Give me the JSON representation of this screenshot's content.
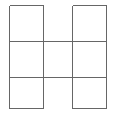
{
  "figure": {
    "shape_name": "H-tetromino-grid",
    "background_color": "#ffffff",
    "line_color": "#666666",
    "line_width": 1,
    "canvas": {
      "width": 115,
      "height": 114
    }
  },
  "grid": {
    "columns": 3,
    "rows": 3,
    "x_positions": [
      9,
      43,
      72,
      106
    ],
    "y_positions": [
      5,
      41,
      77,
      108
    ],
    "cell_labels": [
      "left-top",
      "center-top",
      "right-top",
      "left-middle",
      "center-middle",
      "right-middle",
      "left-bottom",
      "center-bottom",
      "right-bottom"
    ],
    "filled_cells": [
      {
        "id": "left-top",
        "row": 0,
        "col": 0,
        "present": true
      },
      {
        "id": "center-top",
        "row": 0,
        "col": 1,
        "present": false
      },
      {
        "id": "right-top",
        "row": 0,
        "col": 2,
        "present": true
      },
      {
        "id": "left-middle",
        "row": 1,
        "col": 0,
        "present": true
      },
      {
        "id": "center-middle",
        "row": 1,
        "col": 1,
        "present": true
      },
      {
        "id": "right-middle",
        "row": 1,
        "col": 2,
        "present": true
      },
      {
        "id": "left-bottom",
        "row": 2,
        "col": 0,
        "present": true
      },
      {
        "id": "center-bottom",
        "row": 2,
        "col": 1,
        "present": false
      },
      {
        "id": "right-bottom",
        "row": 2,
        "col": 2,
        "present": true
      }
    ]
  },
  "segments": {
    "vertical": [
      {
        "id": "v-left-outer",
        "x": 9,
        "y1": 5,
        "y2": 108
      },
      {
        "id": "v-left-inner",
        "x": 43,
        "y1": 5,
        "y2": 108
      },
      {
        "id": "v-right-inner",
        "x": 72,
        "y1": 5,
        "y2": 108
      },
      {
        "id": "v-right-outer",
        "x": 106,
        "y1": 5,
        "y2": 108
      }
    ],
    "horizontal": [
      {
        "id": "h-top-left",
        "y": 5,
        "x1": 9,
        "x2": 43
      },
      {
        "id": "h-top-right",
        "y": 5,
        "x1": 72,
        "x2": 106
      },
      {
        "id": "h-upper-middle",
        "y": 41,
        "x1": 9,
        "x2": 106
      },
      {
        "id": "h-lower-middle",
        "y": 77,
        "x1": 9,
        "x2": 106
      },
      {
        "id": "h-bottom-left",
        "y": 108,
        "x1": 9,
        "x2": 43
      },
      {
        "id": "h-bottom-right",
        "y": 108,
        "x1": 72,
        "x2": 106
      }
    ]
  }
}
